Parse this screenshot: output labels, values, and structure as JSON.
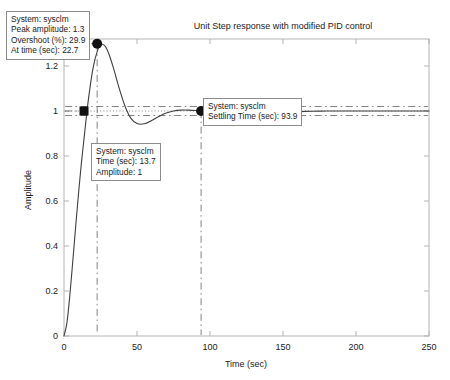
{
  "figure": {
    "title": "Unit Step response with modified PID control",
    "width": 450,
    "height": 380
  },
  "axes": {
    "xlabel": "Time (sec)",
    "ylabel": "Amplitude",
    "xticks": [
      "0",
      "50",
      "100",
      "150",
      "200",
      "250"
    ],
    "xtick_values": [
      0,
      50,
      100,
      150,
      200,
      250
    ],
    "yticks": [
      "0",
      "0.2",
      "0.4",
      "0.6",
      "0.8",
      "1",
      "1.2"
    ],
    "ytick_values": [
      0,
      0.2,
      0.4,
      0.6,
      0.8,
      1,
      1.2
    ],
    "xlim": [
      0,
      250
    ],
    "ylim": [
      0,
      1.32
    ],
    "grid": false,
    "box_color": "#b4b4b4"
  },
  "annotations": [
    {
      "id": "peak",
      "lines": [
        "System: sysclm",
        "Peak amplitude: 1.3",
        "Overshoot (%): 29.9",
        "At time (sec): 22.7"
      ],
      "marker": "circle",
      "point_time": 22.7,
      "point_amplitude": 1.299
    },
    {
      "id": "settling",
      "lines": [
        "System: sysclm",
        "Settling Time (sec): 93.9"
      ],
      "marker": "circle",
      "point_time": 93.9,
      "point_amplitude": 1.0
    },
    {
      "id": "rise",
      "lines": [
        "System: sysclm",
        "Time (sec): 13.7",
        "Amplitude: 1"
      ],
      "marker": "square",
      "point_time": 13.7,
      "point_amplitude": 1.0
    }
  ],
  "chart_data": {
    "type": "line",
    "title": "Unit Step response with modified PID control",
    "xlabel": "Time (sec)",
    "ylabel": "Amplitude",
    "xlim": [
      0,
      250
    ],
    "ylim": [
      0,
      1.32
    ],
    "grid": false,
    "legend": null,
    "line_color": "#3f3f3f",
    "series": [
      {
        "name": "Unit step response",
        "x": [
          0,
          2,
          4,
          6,
          8,
          10,
          12,
          13.7,
          16,
          18,
          20,
          22.7,
          25,
          28,
          31,
          34,
          38,
          42,
          46,
          50,
          55,
          60,
          65,
          70,
          75,
          80,
          85,
          90,
          93.9,
          100,
          110,
          120,
          130,
          140,
          150,
          160,
          170,
          180,
          190,
          200,
          220,
          240,
          250
        ],
        "y": [
          0,
          0.058,
          0.181,
          0.331,
          0.487,
          0.637,
          0.774,
          0.876,
          1.014,
          1.113,
          1.194,
          1.264,
          1.294,
          1.289,
          1.249,
          1.188,
          1.097,
          1.018,
          0.966,
          0.944,
          0.943,
          0.958,
          0.976,
          0.991,
          1.0,
          1.004,
          1.004,
          1.002,
          1.001,
          0.998,
          0.994,
          0.992,
          0.992,
          0.993,
          0.995,
          0.997,
          0.999,
          1.0,
          1.0,
          1.0,
          1.0,
          1.0,
          1.0
        ]
      }
    ],
    "reference_lines": [
      {
        "name": "steady-state",
        "type": "horizontal",
        "value": 1.0,
        "style": "dotted"
      },
      {
        "name": "settling-band-upper",
        "type": "horizontal",
        "value": 1.02,
        "style": "dashdot"
      },
      {
        "name": "settling-band-lower",
        "type": "horizontal",
        "value": 0.98,
        "style": "dashdot"
      },
      {
        "name": "peak-droplines",
        "type": "vertical",
        "value": 22.7,
        "style": "dashdot"
      },
      {
        "name": "settling-dropline",
        "type": "vertical",
        "value": 93.9,
        "style": "dashdot"
      },
      {
        "name": "peak-level",
        "type": "horizontal-partial",
        "value": 1.299,
        "style": "dashdot"
      }
    ],
    "markers": [
      {
        "name": "peak-marker",
        "shape": "circle",
        "x": 22.7,
        "y": 1.299
      },
      {
        "name": "settling-marker",
        "shape": "circle",
        "x": 93.9,
        "y": 1.0
      },
      {
        "name": "rise-marker",
        "shape": "square",
        "x": 13.7,
        "y": 1.0
      }
    ]
  }
}
